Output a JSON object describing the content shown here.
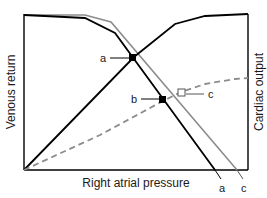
{
  "diagram": {
    "axes": {
      "xlabel": "Right atrial pressure",
      "ylabel_left": "Venous return",
      "ylabel_right": "Cardiac output"
    },
    "points": {
      "a": {
        "label": "a",
        "marker": "filled-square"
      },
      "b": {
        "label": "b",
        "marker": "filled-square"
      },
      "c": {
        "label": "c",
        "marker": "open-square"
      }
    },
    "curves": {
      "venous_return_a": {
        "label": "a",
        "style": "solid",
        "color": "#000000"
      },
      "venous_return_c": {
        "label": "c",
        "style": "solid",
        "color": "#8c8c8c"
      },
      "cardiac_output_normal": {
        "style": "solid",
        "color": "#000000"
      },
      "cardiac_output_depressed": {
        "style": "dashed",
        "color": "#8c8c8c"
      }
    }
  }
}
